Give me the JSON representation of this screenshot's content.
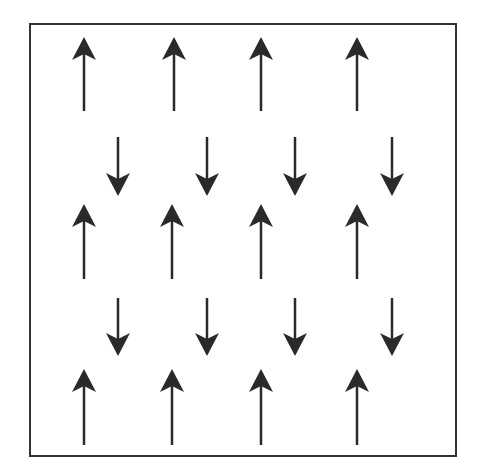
{
  "diagram": {
    "colors": {
      "arrow": "#2a2a2a",
      "frame": "#333333",
      "background": "#ffffff"
    },
    "rows": [
      {
        "direction": "up",
        "x": [
          84,
          174,
          261,
          357
        ],
        "y_top": 37,
        "y_bottom": 111
      },
      {
        "direction": "down",
        "x": [
          118,
          207,
          295,
          392
        ],
        "y_top": 137,
        "y_bottom": 196
      },
      {
        "direction": "up",
        "x": [
          84,
          172,
          261,
          357
        ],
        "y_top": 204,
        "y_bottom": 279
      },
      {
        "direction": "down",
        "x": [
          118,
          207,
          295,
          392
        ],
        "y_top": 298,
        "y_bottom": 356
      },
      {
        "direction": "up",
        "x": [
          84,
          172,
          261,
          357
        ],
        "y_top": 369,
        "y_bottom": 445
      }
    ]
  }
}
